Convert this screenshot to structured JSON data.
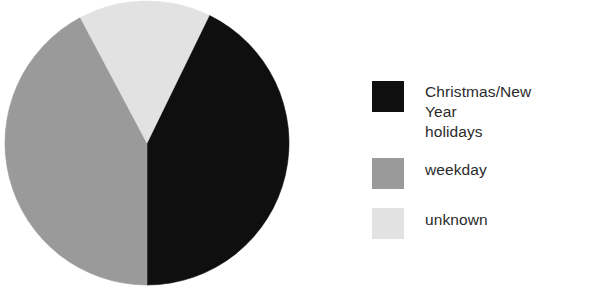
{
  "chart_data": {
    "type": "pie",
    "title": "",
    "subtitle": "",
    "xlabel": "",
    "ylabel": "",
    "grid": false,
    "legend_position": "right",
    "start_angle_deg_from_12oclock": 26,
    "direction": "clockwise",
    "center_px": [
      147,
      143
    ],
    "radius_px": 142,
    "labels": [
      "Christmas/New Year holidays",
      "weekday",
      "unknown"
    ],
    "values": [
      42.8,
      42.2,
      15.0
    ],
    "sweep_degrees": [
      154,
      152,
      54
    ],
    "colors": [
      "#0f0f0f",
      "#9a9a9a",
      "#e2e2e2"
    ],
    "slices": [
      {
        "label": "Christmas/New Year holidays",
        "value": 42.8,
        "sweep_deg": 154,
        "start_deg": 26,
        "end_deg": 180,
        "color": "#0f0f0f"
      },
      {
        "label": "weekday",
        "value": 42.2,
        "sweep_deg": 152,
        "start_deg": 180,
        "end_deg": 332,
        "color": "#9a9a9a"
      },
      {
        "label": "unknown",
        "value": 15.0,
        "sweep_deg": 54,
        "start_deg": 332,
        "end_deg": 386,
        "color": "#e2e2e2"
      }
    ]
  },
  "legend": {
    "items": [
      {
        "label": "Christmas/New Year\nholidays",
        "color": "#0f0f0f",
        "swatch_name": "legend-swatch-christmas-new-year-holidays"
      },
      {
        "label": "weekday",
        "color": "#9a9a9a",
        "swatch_name": "legend-swatch-weekday"
      },
      {
        "label": "unknown",
        "color": "#e2e2e2",
        "swatch_name": "legend-swatch-unknown"
      }
    ]
  },
  "page": {
    "background": "#ffffff",
    "text_color": "#2b2b2b"
  }
}
